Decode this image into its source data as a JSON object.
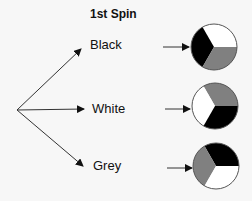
{
  "title": "1st Spin",
  "outcomes": [
    {
      "label": "Black",
      "spinner": {
        "top_right": "white",
        "bottom_right": "grey",
        "left": "black"
      }
    },
    {
      "label": "White",
      "spinner": {
        "top_right": "grey",
        "bottom_right": "black",
        "left": "white"
      }
    },
    {
      "label": "Grey",
      "spinner": {
        "top_right": "black",
        "bottom_right": "white",
        "left": "grey"
      }
    }
  ],
  "colors": {
    "black": "#000000",
    "white": "#ffffff",
    "grey": "#808080",
    "background": "#f7f7f7",
    "line": "#222222"
  }
}
